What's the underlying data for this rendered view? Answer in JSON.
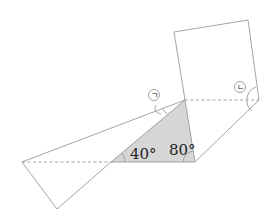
{
  "diagram": {
    "type": "folded-paper-geometry",
    "angles": [
      {
        "id": "angle-40",
        "label": "40°"
      },
      {
        "id": "angle-80",
        "label": "80°"
      }
    ],
    "markers": [
      {
        "id": "marker-giyeok",
        "label": "ㄱ"
      },
      {
        "id": "marker-nieun",
        "label": "ㄴ"
      }
    ],
    "colors": {
      "shade": "#d6d6d6",
      "line": "#9a9a9a"
    }
  }
}
